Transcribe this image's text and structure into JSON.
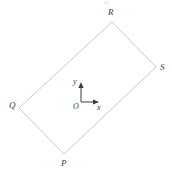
{
  "figure": {
    "background_color": "#ffffff",
    "stroke_color": "#c9c9c9",
    "label_color": "#3c3c3c",
    "stroke_width": 1,
    "canvas": {
      "width": 172,
      "height": 178
    },
    "shape": {
      "name": "rectangle",
      "label": "PQRS",
      "closed": true,
      "vertices": [
        {
          "name": "P",
          "label": "P",
          "x": 64,
          "y": 154,
          "label_x": 61,
          "label_y": 159
        },
        {
          "name": "Q",
          "label": "Q",
          "x": 19,
          "y": 108,
          "label_x": 9,
          "label_y": 101
        },
        {
          "name": "R",
          "label": "R",
          "x": 112,
          "y": 22,
          "label_x": 108,
          "label_y": 8
        },
        {
          "name": "S",
          "label": "S",
          "x": 156,
          "y": 67,
          "label_x": 160,
          "label_y": 63
        }
      ],
      "edges": [
        {
          "from": "Q",
          "to": "R"
        },
        {
          "from": "R",
          "to": "S"
        },
        {
          "from": "S",
          "to": "P"
        },
        {
          "from": "P",
          "to": "Q"
        }
      ]
    },
    "axes": {
      "origin": {
        "label": "O",
        "x": 81,
        "y": 102,
        "label_x": 73,
        "label_y": 103
      },
      "x_axis": {
        "label": "x",
        "tip_x": 98,
        "tip_y": 102,
        "label_x": 97,
        "label_y": 104
      },
      "y_axis": {
        "label": "y",
        "tip_x": 81,
        "tip_y": 83,
        "label_x": 73,
        "label_y": 78
      },
      "arrow_color": "#3c3c3c"
    }
  }
}
